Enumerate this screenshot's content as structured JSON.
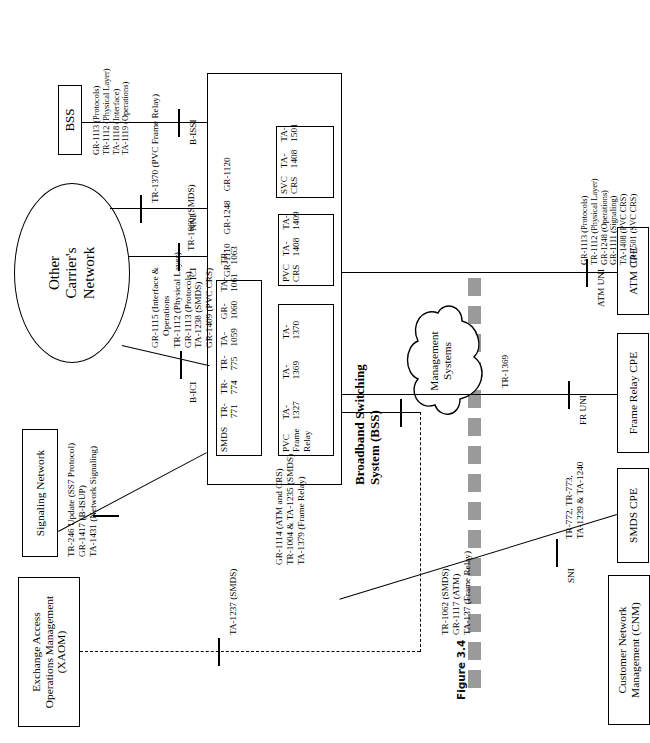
{
  "figure": {
    "caption": "Figure 3.4",
    "domain": "telecom-network-architecture-diagram"
  },
  "nodes": {
    "xaom": {
      "label": "Exchange Access\nOperations Management\n(XAOM)",
      "line1": "Exchange Access",
      "line2": "Operations Management",
      "line3": "(XAOM)"
    },
    "signaling_network": {
      "label": "Signaling Network"
    },
    "other_carrier": {
      "line1": "Other",
      "line2": "Carrier's",
      "line3": "Network"
    },
    "bss_small": {
      "label": "BSS"
    },
    "management_systems": {
      "line1": "Management",
      "line2": "Systems"
    },
    "cnm": {
      "line1": "Customer Network",
      "line2": "Management (CNM)"
    },
    "bss_main": {
      "line1": "Broadband Switching",
      "line2": "System (BSS)"
    },
    "smds_cpe": {
      "label": "SMDS CPE"
    },
    "frame_relay_cpe": {
      "label": "Frame Relay CPE"
    },
    "atm_cpe": {
      "label": "ATM CPE"
    }
  },
  "bss_inner_boxes": {
    "smds": {
      "title": "SMDS",
      "items": [
        "TR-771",
        "TR-774",
        "TR-775",
        "TA-1059",
        "GR-1060",
        "TA-1061",
        "TR-1063"
      ]
    },
    "pvc_frame_relay": {
      "title_line1": "PVC",
      "title_line2": "Frame",
      "title_line3": "Relay",
      "items": [
        "TA-1327",
        "TA-1369",
        "TA-1370"
      ]
    },
    "pvc_crs": {
      "title": "PVC CRS",
      "items": [
        "TA-1408",
        "TA-1409"
      ]
    },
    "svc_crs": {
      "title": "SVC CRS",
      "items": [
        "TA-1408",
        "TA-1501"
      ]
    },
    "bss_generic": {
      "items": [
        "GR-1110",
        "GR-1248",
        "GR-1120"
      ]
    }
  },
  "interfaces": {
    "b_ici": {
      "name": "B-ICI",
      "specs": [
        "GR-1115 (Interface &",
        "Operations",
        "TR-1112 (Physical Layer)",
        "GR-1113 (Protocols)",
        "TA-1238 (SMDS)",
        "GR-1409 (PVC CRS)"
      ]
    },
    "ici": {
      "name": "ICI",
      "specs": [
        "TR-1060 (SMDS)"
      ]
    },
    "nni": {
      "name": "NNI",
      "specs": [
        "TR-1370 (PVC Frame Relay)"
      ]
    },
    "b_issi": {
      "name": "B-ISSI",
      "specs": [
        "GR-1113 (Protocols)",
        "TR-1112 (Physical Layer)",
        "TA-1118 (Interface)",
        "TA-1119 (Operations)"
      ]
    },
    "sni": {
      "name": "SNI",
      "specs": [
        "TR-772, TR-773,",
        "TA-1239 & TA-1240"
      ]
    },
    "fr_uni": {
      "name": "FR UNI",
      "specs": [
        "TR-1369"
      ]
    },
    "atm_uni": {
      "name": "ATM UNI",
      "specs": [
        "GR-1113 (Protocols)",
        "TR-1112 (Physical Layer)",
        "GR-1248 (Operations)",
        "GR-1111 (Signaling)",
        "TA-1408 (PVC CRS)",
        "TA-1501 (SVC CRS)"
      ]
    },
    "signaling_link": {
      "specs": [
        "TR-246 Update (SS7 Protocol)",
        "GR-1417 (B-ISUP)",
        "TA-1431 (Network Signaling)"
      ]
    },
    "xaom_link": {
      "specs": [
        "TA-1237 (SMDS)"
      ]
    },
    "mgmt_to_bss": {
      "specs": [
        "GR-1114 (ATM and CRS)",
        "TR-1004 & TA-1235 (SMDS)",
        "TA-1379 (Frame Relay)"
      ]
    },
    "cnm_link": {
      "specs": [
        "TR-1062 (SMDS)",
        "GR-1117 (ATM)",
        "TA-137 (Frame Relay)"
      ]
    }
  },
  "colors": {
    "ink": "#000000",
    "paper": "#ffffff",
    "rail": "#9a9a9a",
    "caption": "#111111"
  }
}
